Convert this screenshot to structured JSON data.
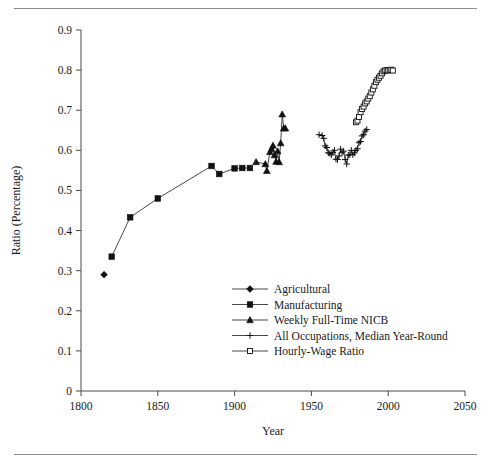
{
  "page": {
    "top_rule": "horizontal-rule",
    "bottom_rule": "horizontal-rule"
  },
  "chart_data": {
    "type": "line",
    "title": "",
    "xlabel": "Year",
    "ylabel": "Ratio (Percentage)",
    "xlim": [
      1800,
      2050
    ],
    "ylim": [
      0,
      0.9
    ],
    "xticks": [
      1800,
      1850,
      1900,
      1950,
      2000,
      2050
    ],
    "xticklabels": [
      "1800",
      "1850",
      "1900",
      "1950",
      "2000",
      "2050"
    ],
    "yticks": [
      0,
      0.1,
      0.2,
      0.3,
      0.4,
      0.5,
      0.6,
      0.7,
      0.8,
      0.9
    ],
    "yticklabels": [
      "0",
      "0.1",
      "0.2",
      "0.3",
      "0.4",
      "0.5",
      "0.6",
      "0.7",
      "0.8",
      "0.9"
    ],
    "grid": false,
    "legend_position": "center",
    "series": [
      {
        "name": "Agricultural",
        "marker": "diamond",
        "points": [
          [
            1815,
            0.29
          ]
        ]
      },
      {
        "name": "Manufacturing",
        "marker": "filled-square",
        "points": [
          [
            1820,
            0.335
          ],
          [
            1832,
            0.433
          ],
          [
            1850,
            0.48
          ],
          [
            1885,
            0.561
          ],
          [
            1890,
            0.541
          ],
          [
            1900,
            0.555
          ],
          [
            1905,
            0.556
          ],
          [
            1910,
            0.556
          ]
        ]
      },
      {
        "name": "Weekly Full-Time NICB",
        "marker": "triangle",
        "points": [
          [
            1914,
            0.571
          ],
          [
            1920,
            0.566
          ],
          [
            1921,
            0.549
          ],
          [
            1923,
            0.596
          ],
          [
            1924,
            0.603
          ],
          [
            1925,
            0.612
          ],
          [
            1926,
            0.588
          ],
          [
            1927,
            0.572
          ],
          [
            1928,
            0.598
          ],
          [
            1929,
            0.571
          ],
          [
            1930,
            0.618
          ],
          [
            1931,
            0.69
          ],
          [
            1932,
            0.655
          ],
          [
            1933,
            0.655
          ]
        ]
      },
      {
        "name": "All Occupations, Median Year-Round",
        "marker": "plus",
        "points": [
          [
            1955,
            0.639
          ],
          [
            1957,
            0.637
          ],
          [
            1958,
            0.63
          ],
          [
            1959,
            0.611
          ],
          [
            1960,
            0.607
          ],
          [
            1961,
            0.594
          ],
          [
            1962,
            0.592
          ],
          [
            1963,
            0.589
          ],
          [
            1964,
            0.595
          ],
          [
            1965,
            0.6
          ],
          [
            1966,
            0.578
          ],
          [
            1967,
            0.577
          ],
          [
            1968,
            0.586
          ],
          [
            1969,
            0.603
          ],
          [
            1970,
            0.594
          ],
          [
            1971,
            0.598
          ],
          [
            1972,
            0.577
          ],
          [
            1973,
            0.566
          ],
          [
            1974,
            0.588
          ],
          [
            1975,
            0.589
          ],
          [
            1976,
            0.6
          ],
          [
            1977,
            0.589
          ],
          [
            1978,
            0.594
          ],
          [
            1979,
            0.6
          ],
          [
            1980,
            0.604
          ],
          [
            1981,
            0.619
          ],
          [
            1982,
            0.622
          ],
          [
            1983,
            0.636
          ],
          [
            1984,
            0.639
          ],
          [
            1985,
            0.648
          ],
          [
            1986,
            0.652
          ]
        ]
      },
      {
        "name": "Hourly-Wage Ratio",
        "marker": "open-square",
        "points": [
          [
            1979,
            0.67
          ],
          [
            1980,
            0.674
          ],
          [
            1981,
            0.683
          ],
          [
            1982,
            0.695
          ],
          [
            1983,
            0.703
          ],
          [
            1984,
            0.709
          ],
          [
            1985,
            0.717
          ],
          [
            1986,
            0.722
          ],
          [
            1987,
            0.729
          ],
          [
            1988,
            0.735
          ],
          [
            1989,
            0.744
          ],
          [
            1990,
            0.752
          ],
          [
            1991,
            0.761
          ],
          [
            1992,
            0.77
          ],
          [
            1993,
            0.776
          ],
          [
            1994,
            0.781
          ],
          [
            1995,
            0.786
          ],
          [
            1996,
            0.792
          ],
          [
            1997,
            0.797
          ],
          [
            1998,
            0.799
          ],
          [
            1999,
            0.8
          ],
          [
            2000,
            0.799
          ],
          [
            2001,
            0.8
          ],
          [
            2002,
            0.801
          ],
          [
            2003,
            0.799
          ]
        ]
      }
    ],
    "legend": [
      {
        "label": "Agricultural",
        "marker": "diamond"
      },
      {
        "label": "Manufacturing",
        "marker": "filled-square"
      },
      {
        "label": "Weekly Full-Time NICB",
        "marker": "triangle"
      },
      {
        "label": "All Occupations, Median Year-Round",
        "marker": "plus"
      },
      {
        "label": "Hourly-Wage Ratio",
        "marker": "open-square"
      }
    ]
  }
}
